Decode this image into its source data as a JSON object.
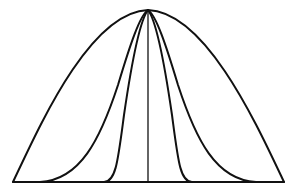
{
  "diagram": {
    "stroke_color": "#111111",
    "background": "#ffffff",
    "apex": [
      148,
      10
    ],
    "baseline": {
      "y": 182,
      "x_start": 13,
      "x_end": 284
    },
    "center_line_x": 148,
    "curves": [
      {
        "name": "outer",
        "left_foot_x": 13,
        "right_foot_x": 284
      },
      {
        "name": "middle",
        "left_foot_x": 40,
        "right_foot_x": 255
      },
      {
        "name": "inner",
        "left_foot_x": 105,
        "right_foot_x": 192
      }
    ]
  }
}
